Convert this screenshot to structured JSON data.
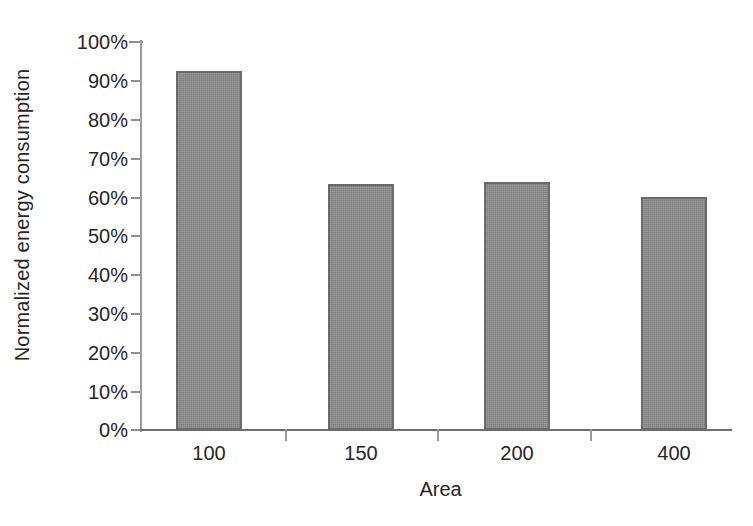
{
  "chart_data": {
    "type": "bar",
    "title": "",
    "xlabel": "Area",
    "ylabel": "Normalized energy consumption",
    "categories": [
      "100",
      "150",
      "200",
      "400"
    ],
    "values": [
      92.5,
      63.5,
      64.0,
      60.0
    ],
    "value_labels": [
      "92.5%",
      "63.5%",
      "64.0%",
      "60.0%"
    ],
    "ylim": [
      0,
      100
    ],
    "yticks": [
      0,
      10,
      20,
      30,
      40,
      50,
      60,
      70,
      80,
      90,
      100
    ],
    "ytick_labels": [
      "0%",
      "10%",
      "20%",
      "30%",
      "40%",
      "50%",
      "60%",
      "70%",
      "80%",
      "90%",
      "100%"
    ],
    "grid": false,
    "legend": null,
    "bar_color": "#8c8c8c",
    "bar_border_color": "#6a6a6a",
    "axis_color": "#8f8f8f",
    "background_color": "#ffffff"
  },
  "axes": {
    "y_title": "Normalized energy consumption",
    "x_title": "Area",
    "y_labels": [
      "100%",
      "90%",
      "80%",
      "70%",
      "60%",
      "50%",
      "40%",
      "30%",
      "20%",
      "10%",
      "0%"
    ],
    "x_labels": [
      "100",
      "150",
      "200",
      "400"
    ]
  }
}
